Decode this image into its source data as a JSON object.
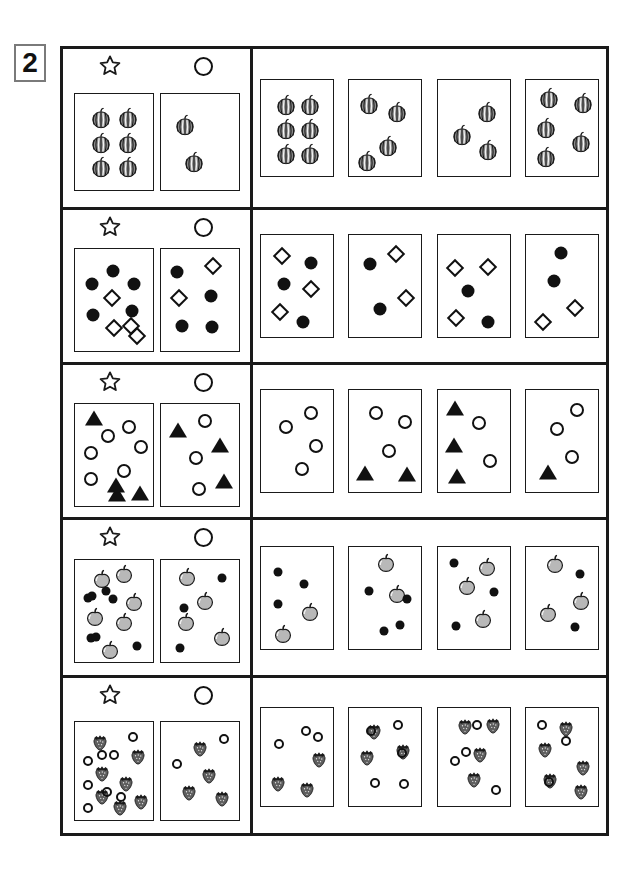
{
  "exercise": {
    "number": "2",
    "header_icons": {
      "prompt": "star-icon",
      "answer": "circle-icon"
    }
  },
  "colors": {
    "ink": "#1a1a1a",
    "melon_fill": "#8a8a8a",
    "apple_fill": "#b8b8b8",
    "strawberry_fill": "#5e5e5e",
    "tag_border": "#7a7a7a"
  },
  "rows": [
    {
      "id": "row-watermelon",
      "item_type": "watermelon",
      "prompt": {
        "star_card": {
          "watermelon": 6
        },
        "circle_card": {
          "watermelon": 2
        }
      },
      "options": [
        {
          "label": "option-1",
          "watermelon": 6
        },
        {
          "label": "option-2",
          "watermelon": 4
        },
        {
          "label": "option-3",
          "watermelon": 3
        },
        {
          "label": "option-4",
          "watermelon": 5
        }
      ]
    },
    {
      "id": "row-circle-diamond",
      "item_type": "circle-and-diamond",
      "prompt": {
        "star_card": {
          "filled_circle": 5,
          "diamond": 4
        },
        "circle_card": {
          "filled_circle": 4,
          "diamond": 2
        }
      },
      "options": [
        {
          "label": "option-1",
          "filled_circle": 3,
          "diamond": 3
        },
        {
          "label": "option-2",
          "filled_circle": 2,
          "diamond": 2
        },
        {
          "label": "option-3",
          "filled_circle": 2,
          "diamond": 3
        },
        {
          "label": "option-4",
          "filled_circle": 2,
          "diamond": 2
        }
      ]
    },
    {
      "id": "row-circle-triangle",
      "item_type": "circle-and-triangle",
      "prompt": {
        "star_card": {
          "open_circle": 6,
          "triangle": 4
        },
        "circle_card": {
          "open_circle": 3,
          "triangle": 3
        }
      },
      "options": [
        {
          "label": "option-1",
          "open_circle": 4,
          "triangle": 0
        },
        {
          "label": "option-2",
          "open_circle": 3,
          "triangle": 2
        },
        {
          "label": "option-3",
          "open_circle": 2,
          "triangle": 3
        },
        {
          "label": "option-4",
          "open_circle": 3,
          "triangle": 1
        }
      ]
    },
    {
      "id": "row-apple-dot",
      "item_type": "apple-and-dot",
      "prompt": {
        "star_card": {
          "apple": 6,
          "dot": 7
        },
        "circle_card": {
          "apple": 4,
          "dot": 3
        }
      },
      "options": [
        {
          "label": "option-1",
          "apple": 2,
          "dot": 3
        },
        {
          "label": "option-2",
          "apple": 2,
          "dot": 4
        },
        {
          "label": "option-3",
          "apple": 3,
          "dot": 3
        },
        {
          "label": "option-4",
          "apple": 3,
          "dot": 2
        }
      ]
    },
    {
      "id": "row-strawberry-circle",
      "item_type": "strawberry-and-circle",
      "prompt": {
        "star_card": {
          "strawberry": 7,
          "open_circle": 8
        },
        "circle_card": {
          "strawberry": 4,
          "open_circle": 2
        }
      },
      "options": [
        {
          "label": "option-1",
          "strawberry": 3,
          "open_circle": 3
        },
        {
          "label": "option-2",
          "strawberry": 3,
          "open_circle": 5
        },
        {
          "label": "option-3",
          "strawberry": 4,
          "open_circle": 4
        },
        {
          "label": "option-4",
          "strawberry": 5,
          "open_circle": 3
        }
      ]
    }
  ],
  "layout": {
    "card_heights": {
      "row1": 98,
      "row2": 104,
      "row3": 104,
      "row4": 104,
      "row5": 100
    },
    "row_heights": [
      161,
      155,
      155,
      158,
      158
    ]
  },
  "positions": {
    "r1_star": [
      [
        26,
        22
      ],
      [
        56,
        22
      ],
      [
        26,
        50
      ],
      [
        56,
        50
      ],
      [
        26,
        78
      ],
      [
        56,
        78
      ]
    ],
    "r1_circle": [
      [
        30,
        28
      ],
      [
        52,
        66
      ]
    ],
    "r1_o1": [
      [
        24,
        22
      ],
      [
        54,
        22
      ],
      [
        24,
        50
      ],
      [
        54,
        50
      ],
      [
        24,
        78
      ],
      [
        54,
        78
      ]
    ],
    "r1_o2": [
      [
        22,
        26
      ],
      [
        50,
        40
      ],
      [
        22,
        64
      ],
      [
        50,
        78
      ]
    ],
    "r1_o3": [
      [
        26,
        32
      ],
      [
        52,
        52
      ],
      [
        24,
        70
      ]
    ],
    "r1_o4": [
      [
        22,
        24
      ],
      [
        54,
        24
      ],
      [
        44,
        50
      ],
      [
        22,
        74
      ],
      [
        54,
        74
      ]
    ],
    "r2_star_c": [
      [
        20,
        22
      ],
      [
        62,
        20
      ],
      [
        50,
        45
      ],
      [
        34,
        66
      ],
      [
        28,
        92
      ]
    ],
    "r2_star_d": [
      [
        42,
        30
      ],
      [
        20,
        48
      ],
      [
        60,
        70
      ],
      [
        22,
        78
      ],
      [
        56,
        94
      ]
    ],
    "r2_circ_c": [
      [
        24,
        28
      ],
      [
        60,
        36
      ],
      [
        24,
        76
      ]
    ],
    "r2_circ_d": [
      [
        40,
        55
      ],
      [
        62,
        80
      ]
    ],
    "r2_circ_c2": [
      [
        24,
        28
      ],
      [
        60,
        36
      ],
      [
        24,
        76
      ],
      [
        60,
        36
      ]
    ],
    "r3_star_o": [
      [
        22,
        22
      ],
      [
        58,
        20
      ],
      [
        20,
        48
      ],
      [
        62,
        56
      ],
      [
        46,
        76
      ],
      [
        24,
        96
      ]
    ],
    "r3_star_t": [
      [
        44,
        34
      ],
      [
        42,
        62
      ],
      [
        22,
        76
      ],
      [
        60,
        96
      ]
    ],
    "r3_circ_o": [
      [
        22,
        26
      ],
      [
        62,
        52
      ],
      [
        24,
        82
      ]
    ],
    "r3_circ_t": [
      [
        56,
        26
      ],
      [
        28,
        54
      ],
      [
        60,
        84
      ]
    ],
    "r4_star_a": [
      [
        22,
        26
      ],
      [
        54,
        34
      ],
      [
        42,
        52
      ],
      [
        22,
        66
      ],
      [
        42,
        82
      ],
      [
        58,
        70
      ]
    ],
    "r4_star_d": [
      [
        40,
        22
      ],
      [
        20,
        46
      ],
      [
        58,
        24
      ],
      [
        58,
        50
      ],
      [
        20,
        86
      ],
      [
        60,
        90
      ],
      [
        24,
        92
      ]
    ],
    "r4_circ_a": [
      [
        24,
        26
      ],
      [
        60,
        44
      ],
      [
        26,
        76
      ],
      [
        58,
        74
      ]
    ],
    "r4_circ_d": [
      [
        56,
        22
      ],
      [
        24,
        52
      ],
      [
        42,
        62
      ]
    ],
    "r5_star_s": [
      [
        20,
        20
      ],
      [
        56,
        20
      ],
      [
        38,
        38
      ],
      [
        20,
        58
      ],
      [
        56,
        56
      ],
      [
        32,
        82
      ],
      [
        58,
        84
      ]
    ],
    "r5_star_o": [
      [
        40,
        22
      ],
      [
        20,
        38
      ],
      [
        56,
        38
      ],
      [
        32,
        58
      ],
      [
        46,
        70
      ],
      [
        18,
        80
      ],
      [
        44,
        88
      ],
      [
        20,
        62
      ]
    ],
    "r5_circ_s": [
      [
        26,
        34
      ],
      [
        58,
        26
      ],
      [
        36,
        58
      ],
      [
        60,
        78
      ]
    ],
    "r5_circ_o": [
      [
        58,
        48
      ],
      [
        22,
        76
      ]
    ]
  }
}
